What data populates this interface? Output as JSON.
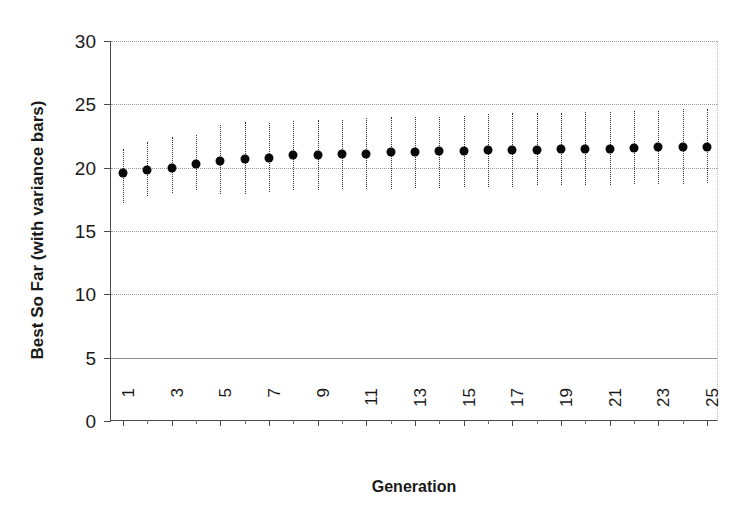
{
  "chart_data": {
    "type": "scatter",
    "title": "",
    "xlabel": "Generation",
    "ylabel": "Best So Far (with variance bars)",
    "xlim": [
      0.5,
      25.5
    ],
    "ylim": [
      0,
      30
    ],
    "yticks": [
      0,
      5,
      10,
      15,
      20,
      25,
      30
    ],
    "xticks": [
      1,
      2,
      3,
      4,
      5,
      6,
      7,
      8,
      9,
      10,
      11,
      12,
      13,
      14,
      15,
      16,
      17,
      18,
      19,
      20,
      21,
      22,
      23,
      24,
      25
    ],
    "xtick_labels": [
      "1",
      "",
      "3",
      "",
      "5",
      "",
      "7",
      "",
      "9",
      "",
      "11",
      "",
      "13",
      "",
      "15",
      "",
      "17",
      "",
      "19",
      "",
      "21",
      "",
      "23",
      "",
      "25"
    ],
    "grid": true,
    "legend": "none",
    "marker_color": "#080808",
    "errorbar_color": "#2b2b2b",
    "grid_color": "#8d8d8d",
    "axis_color": "#4a4a4a",
    "x": [
      1,
      2,
      3,
      4,
      5,
      6,
      7,
      8,
      9,
      10,
      11,
      12,
      13,
      14,
      15,
      16,
      17,
      18,
      19,
      20,
      21,
      22,
      23,
      24,
      25
    ],
    "values": [
      19.6,
      19.8,
      20.0,
      20.3,
      20.5,
      20.7,
      20.8,
      21.0,
      21.0,
      21.1,
      21.1,
      21.2,
      21.25,
      21.3,
      21.3,
      21.4,
      21.4,
      21.4,
      21.45,
      21.45,
      21.5,
      21.55,
      21.6,
      21.6,
      21.65
    ],
    "err_upper": [
      21.5,
      22.0,
      22.4,
      22.6,
      23.4,
      23.6,
      23.5,
      23.7,
      23.8,
      23.8,
      23.9,
      24.0,
      24.0,
      24.0,
      24.1,
      24.2,
      24.3,
      24.3,
      24.3,
      24.4,
      24.4,
      24.5,
      24.5,
      24.6,
      24.6
    ],
    "err_lower": [
      17.2,
      17.8,
      18.0,
      18.2,
      17.9,
      17.9,
      18.1,
      18.2,
      18.2,
      18.3,
      18.3,
      18.3,
      18.4,
      18.4,
      18.5,
      18.5,
      18.5,
      18.6,
      18.6,
      18.6,
      18.6,
      18.7,
      18.7,
      18.7,
      18.8
    ]
  }
}
